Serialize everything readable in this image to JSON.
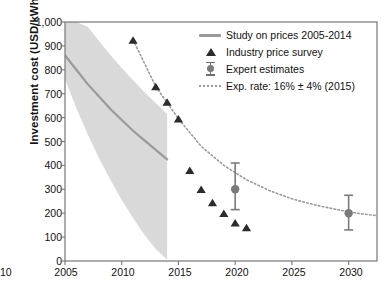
{
  "chart_data": {
    "type": "scatter",
    "title": "",
    "xlabel": "",
    "ylabel": "Investment cost (USD/kWh",
    "ylabel_sub": "cap",
    "ylabel_close": ")",
    "xlim": [
      2005,
      2032.5
    ],
    "ylim": [
      0,
      1000
    ],
    "grid": false,
    "legend_position": "top-right",
    "xticks": [
      2005,
      2010,
      2015,
      2020,
      2025,
      2030
    ],
    "xticklabels": [
      "2005",
      "2010",
      "2015",
      "2020",
      "2025",
      "2030"
    ],
    "yticks": [
      0,
      100,
      200,
      300,
      400,
      500,
      600,
      700,
      800,
      900,
      1000
    ],
    "yticklabels": [
      "0",
      "100",
      "200",
      "300",
      "400",
      "500",
      "600",
      "700",
      "800",
      "900",
      "1,000"
    ],
    "series": [
      {
        "name": "Study on prices 2005-2014",
        "type": "line",
        "style": "solid",
        "color": "#9a9a9a",
        "x": [
          2005,
          2006,
          2007,
          2008,
          2009,
          2010,
          2011,
          2012,
          2013,
          2014
        ],
        "values": [
          860,
          800,
          740,
          688,
          636,
          590,
          545,
          505,
          465,
          425
        ]
      },
      {
        "name": "Study uncertainty band 2005-2014",
        "type": "band",
        "color": "#d9d9d9",
        "x": [
          2005,
          2006,
          2007,
          2008,
          2009,
          2010,
          2011,
          2012,
          2013,
          2014
        ],
        "upper": [
          1000,
          1000,
          980,
          920,
          862,
          808,
          756,
          706,
          660,
          615
        ],
        "lower": [
          760,
          640,
          530,
          430,
          340,
          255,
          180,
          110,
          50,
          5
        ]
      },
      {
        "name": "Industry price survey",
        "type": "scatter",
        "marker": "triangle",
        "color": "#2b2b2b",
        "x": [
          2011,
          2013,
          2014,
          2015,
          2016,
          2017,
          2018,
          2019,
          2020,
          2021
        ],
        "values": [
          925,
          730,
          665,
          595,
          380,
          300,
          245,
          200,
          160,
          140
        ]
      },
      {
        "name": "Expert estimates",
        "type": "errorbar",
        "marker": "circle",
        "color": "#7a7a7a",
        "x": [
          2020,
          2030
        ],
        "values": [
          300,
          200
        ],
        "err_upper": [
          410,
          275
        ],
        "err_lower": [
          215,
          130
        ]
      },
      {
        "name": "Exp. rate: 16% ± 4% (2015)",
        "type": "line",
        "style": "dotted",
        "color": "#9a9a9a",
        "x": [
          2011,
          2013,
          2015,
          2017,
          2019,
          2021,
          2023,
          2025,
          2027,
          2029,
          2031,
          2032.5
        ],
        "values": [
          925,
          730,
          595,
          480,
          400,
          340,
          295,
          260,
          235,
          215,
          198,
          190
        ]
      }
    ]
  },
  "legend": {
    "items": [
      {
        "label": "Study on prices 2005-2014",
        "marker": "solid-line"
      },
      {
        "label": "Industry price survey",
        "marker": "triangle"
      },
      {
        "label": "Expert estimates",
        "marker": "errorbar-circle"
      },
      {
        "label": "Exp. rate: 16% ± 4% (2015)",
        "marker": "dotted-line"
      }
    ]
  },
  "colors": {
    "band": "#d9d9d9",
    "study_line": "#9a9a9a",
    "survey_marker": "#2b2b2b",
    "expert_marker": "#7a7a7a",
    "exp_rate_line": "#9a9a9a",
    "axis": "#555555",
    "text": "#111111"
  }
}
